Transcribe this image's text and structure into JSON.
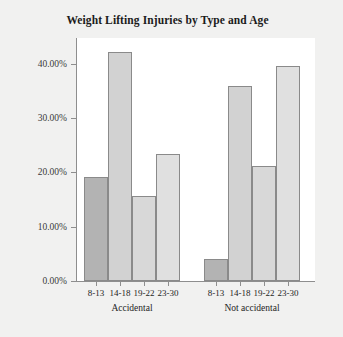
{
  "chart_data": {
    "type": "bar",
    "title": "Weight Lifting Injuries by Type and Age",
    "xlabel": "",
    "ylabel": "Percent",
    "ylim": [
      0,
      45
    ],
    "grid": false,
    "legend": "none",
    "categories": [
      "8-13",
      "14-18",
      "19-22",
      "23-30"
    ],
    "groups": [
      "Accidental",
      "Not accidental"
    ],
    "bars": [
      {
        "group": "Accidental",
        "category": "8-13",
        "value": 19.1,
        "label": "19.10%",
        "color": "#b3b3b3"
      },
      {
        "group": "Accidental",
        "category": "14-18",
        "value": 42.1,
        "label": "42.10%",
        "color": "#d2d2d2"
      },
      {
        "group": "Accidental",
        "category": "19-22",
        "value": 15.7,
        "label": "15.70%",
        "color": "#d8d8d8"
      },
      {
        "group": "Accidental",
        "category": "23-30",
        "value": 23.4,
        "label": "23.40%",
        "color": "#e0e0e0"
      },
      {
        "group": "Not accidental",
        "category": "8-13",
        "value": 4.1,
        "label": "4.10%",
        "color": "#b3b3b3"
      },
      {
        "group": "Not accidental",
        "category": "14-18",
        "value": 36.0,
        "label": "36.00%",
        "color": "#d2d2d2"
      },
      {
        "group": "Not accidental",
        "category": "19-22",
        "value": 21.1,
        "label": "21.10%",
        "color": "#d8d8d8"
      },
      {
        "group": "Not accidental",
        "category": "23-30",
        "value": 39.6,
        "label": "39.60%",
        "color": "#e0e0e0"
      }
    ],
    "yticks": [
      {
        "value": 0,
        "label": "0.00%"
      },
      {
        "value": 10,
        "label": "10.00%"
      },
      {
        "value": 20,
        "label": "20.00%"
      },
      {
        "value": 30,
        "label": "30.00%"
      },
      {
        "value": 40,
        "label": "40.00%"
      }
    ],
    "colors": {
      "background": "#f1f1f0",
      "plot_background": "#ffffff",
      "axis": "#8e8e8e",
      "bar_dark": "#b3b3b3",
      "bar_light": "#d8d8d8",
      "bar_outline": "#8a8a8a",
      "text": "#1b1b1b"
    }
  }
}
